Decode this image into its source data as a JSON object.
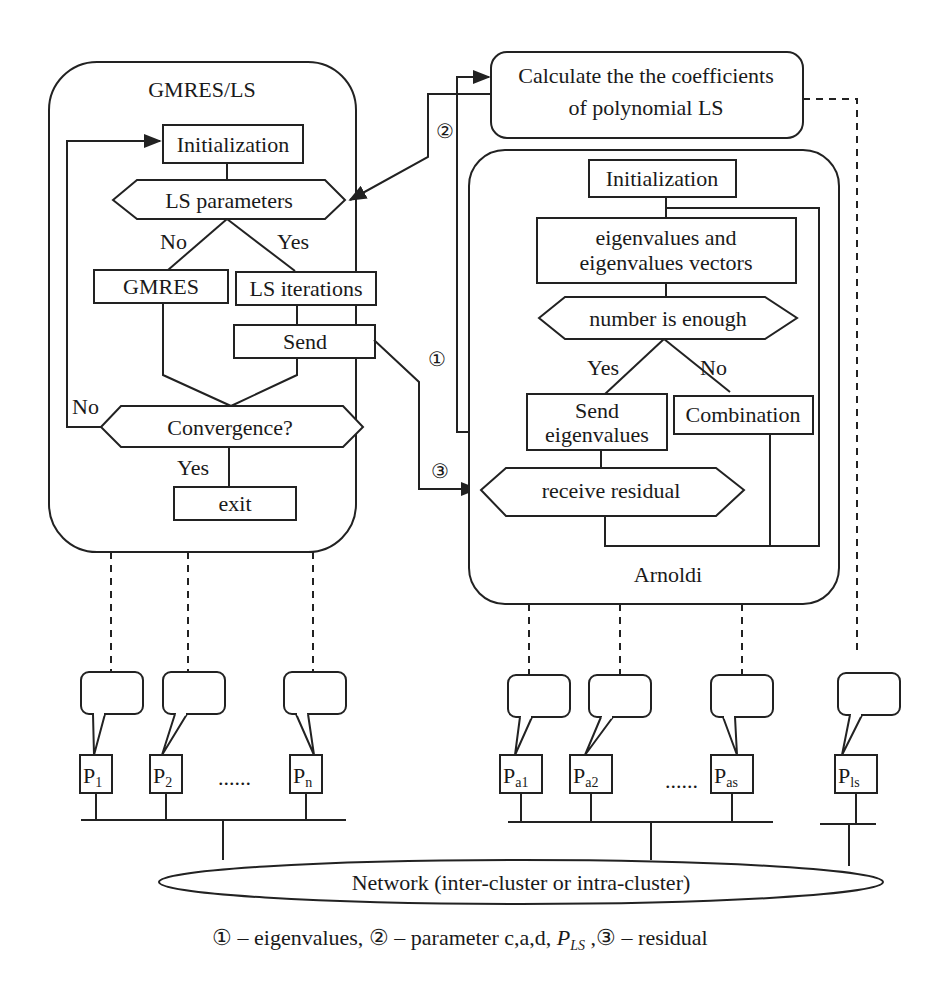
{
  "gmres_ls": {
    "title": "GMRES/LS",
    "initialization": "Initialization",
    "ls_parameters": "LS parameters",
    "no_label": "No",
    "yes_label": "Yes",
    "gmres": "GMRES",
    "ls_iterations": "LS iterations",
    "send": "Send",
    "convergence": "Convergence?",
    "conv_no": "No",
    "conv_yes": "Yes",
    "exit": "exit"
  },
  "ls_coeff": {
    "line1": "Calculate the the coefficients",
    "line2": "of polynomial LS"
  },
  "arnoldi": {
    "title": "Arnoldi",
    "initialization": "Initialization",
    "eigen_line1": "eigenvalues and",
    "eigen_line2": "eigenvalues vectors",
    "number_enough": "number is enough",
    "yes_label": "Yes",
    "no_label": "No",
    "send_line1": "Send",
    "send_line2": "eigenvalues",
    "combination": "Combination",
    "receive_residual": "receive residual"
  },
  "markers": {
    "m1": "①",
    "m2": "②",
    "m3": "③"
  },
  "processors": {
    "gmres": [
      {
        "base": "P",
        "sub": "1"
      },
      {
        "base": "P",
        "sub": "2"
      },
      {
        "base": "P",
        "sub": "n"
      }
    ],
    "arnoldi": [
      {
        "base": "P",
        "sub": "a1"
      },
      {
        "base": "P",
        "sub": "a2"
      },
      {
        "base": "P",
        "sub": "as"
      }
    ],
    "ls": [
      {
        "base": "P",
        "sub": "ls"
      }
    ],
    "ellipsis": "......"
  },
  "network": {
    "label": "Network (inter-cluster or intra-cluster)"
  },
  "legend": {
    "m1": "①",
    "t1": " – eigenvalues, ",
    "m2": "②",
    "t2": " – parameter c,a,d, ",
    "pls_base": "P",
    "pls_sub": "LS",
    "t3": " ,",
    "m3": "③",
    "t4": " – residual"
  }
}
